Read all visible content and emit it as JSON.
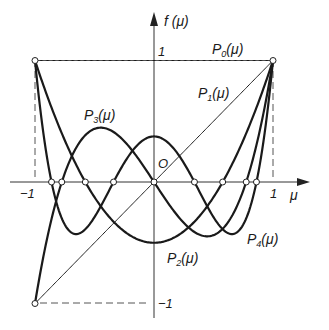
{
  "chart_data": {
    "type": "line",
    "title": "",
    "xlabel": "μ",
    "ylabel": "f(μ)",
    "xlim": [
      -1,
      1
    ],
    "ylim": [
      -1,
      1
    ],
    "origin_label": "O",
    "x_ticks": [
      "-1",
      "1"
    ],
    "y_ticks": [
      "1",
      "-1"
    ],
    "series": [
      {
        "name": "P0(μ)",
        "formula": "1"
      },
      {
        "name": "P1(μ)",
        "formula": "μ"
      },
      {
        "name": "P2(μ)",
        "formula": "(3μ²-1)/2"
      },
      {
        "name": "P3(μ)",
        "formula": "(5μ³-3μ)/2"
      },
      {
        "name": "P4(μ)",
        "formula": "(35μ⁴-30μ²+3)/8"
      }
    ],
    "marked_zeros": [
      -0.861,
      -0.775,
      -0.577,
      -0.34,
      0,
      0.34,
      0.577,
      0.775,
      0.861
    ],
    "endpoints": [
      [
        -1,
        1
      ],
      [
        1,
        1
      ],
      [
        -1,
        -1
      ]
    ]
  },
  "labels": {
    "y_axis": "f",
    "y_axis_arg": "(μ)",
    "x_axis": "μ",
    "origin": "O",
    "x_neg_one": "−1",
    "x_pos_one": "1",
    "y_pos_one": "1",
    "y_neg_one": "−1",
    "P": "P",
    "paren": "(μ)",
    "sub0": "0",
    "sub1": "1",
    "sub2": "2",
    "sub3": "3",
    "sub4": "4"
  },
  "colors": {
    "curve": "#1a1a1a",
    "axis": "#333333",
    "dash": "#555555"
  }
}
